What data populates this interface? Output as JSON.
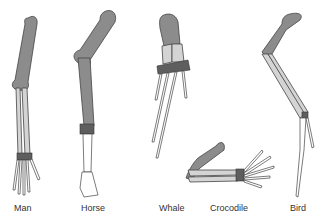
{
  "labels": {
    "man": "Man",
    "horse": "Horse",
    "whale": "Whale",
    "crocodile": "Crocodile",
    "bird": "Bird"
  },
  "colors": {
    "humerus": "#8c8c8c",
    "radius_ulna": "#d4d4d4",
    "carpals": "#5e5e5e",
    "phalanges": "#ffffff",
    "outline": "#444444",
    "background": "#ffffff"
  }
}
